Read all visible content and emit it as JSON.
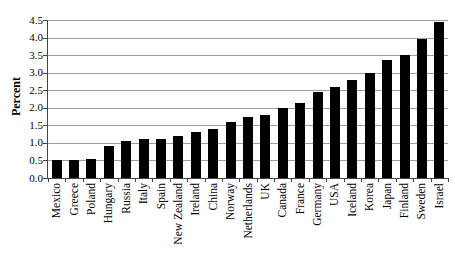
{
  "chart_data": {
    "type": "bar",
    "title": "",
    "xlabel": "",
    "ylabel": "Percent",
    "ylim": [
      0,
      4.5
    ],
    "ytick_step": 0.5,
    "ytick_labels": [
      "0.0",
      "0.5",
      "1.0",
      "1.5",
      "2.0",
      "2.5",
      "3.0",
      "3.5",
      "4.0",
      "4.5"
    ],
    "grid": true,
    "legend_position": "none",
    "categories": [
      "Mexico",
      "Greece",
      "Poland",
      "Hungary",
      "Russia",
      "Italy",
      "Spain",
      "New Zealand",
      "Ireland",
      "China",
      "Norway",
      "Netherlands",
      "UK",
      "Canada",
      "France",
      "Germany",
      "USA",
      "Iceland",
      "Korea",
      "Japan",
      "Finland",
      "Sweden",
      "Israel"
    ],
    "values": [
      0.5,
      0.5,
      0.55,
      0.9,
      1.05,
      1.1,
      1.1,
      1.2,
      1.3,
      1.4,
      1.6,
      1.75,
      1.8,
      2.0,
      2.15,
      2.45,
      2.6,
      2.8,
      3.0,
      3.35,
      3.5,
      3.95,
      4.45
    ],
    "colors": {
      "bar": "#000000",
      "gridline": "#9c9c9c",
      "axis": "#444444",
      "text": "#000000",
      "background": "#ffffff"
    }
  }
}
